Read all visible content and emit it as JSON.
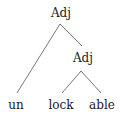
{
  "tree": {
    "root": {
      "label": "Adj"
    },
    "inner": {
      "label": "Adj"
    },
    "leaves": [
      {
        "label": "un"
      },
      {
        "label": "lock"
      },
      {
        "label": "able"
      }
    ]
  },
  "colors": {
    "line": "#555555",
    "text": "#1a1a1a",
    "background": "#ffffff"
  }
}
